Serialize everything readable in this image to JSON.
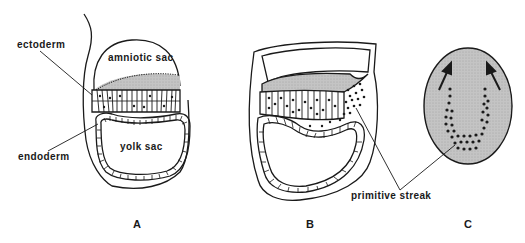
{
  "figure": {
    "labels": {
      "ectoderm": "ectoderm",
      "endoderm": "endoderm",
      "amniotic_sac": "amniotic sac",
      "yolk_sac": "yolk sac",
      "primitive_streak": "primitive streak"
    },
    "panels": [
      "A",
      "B",
      "C"
    ],
    "colors": {
      "stroke": "#1a1a1a",
      "fill_gray": "#bdbdbd",
      "background": "#ffffff"
    }
  }
}
